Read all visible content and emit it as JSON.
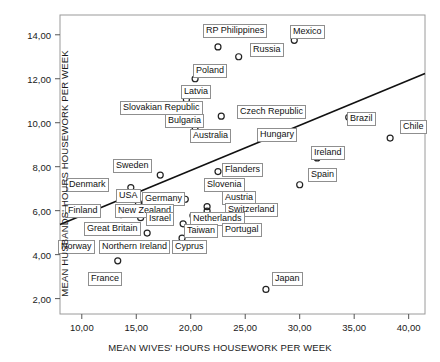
{
  "chart_data": {
    "type": "scatter",
    "title": "",
    "xlabel": "MEAN WIVES' HOURS HOUSEWORK PER WEEK",
    "ylabel": "MEAN HUSBANDS' HOURS HOUSEWORK PER WEEK",
    "xlim": [
      8.0,
      41.5
    ],
    "ylim": [
      1.3,
      14.9
    ],
    "xticks": [
      "10,00",
      "15,00",
      "20,00",
      "25,00",
      "30,00",
      "35,00",
      "40,00"
    ],
    "xtick_values": [
      10,
      15,
      20,
      25,
      30,
      35,
      40
    ],
    "yticks": [
      "2,00",
      "4,00",
      "6,00",
      "8,00",
      "10,00",
      "12,00",
      "14,00"
    ],
    "ytick_values": [
      2,
      4,
      6,
      8,
      10,
      12,
      14
    ],
    "grid": false,
    "legend": "none",
    "marker": "open-circle",
    "marker_color": "#222222",
    "frame_color": "#9a9a9a",
    "fit_line": {
      "label": "linear fit",
      "color": "#111111",
      "x_start": 8.0,
      "y_start": 5.37,
      "x_end": 41.5,
      "y_end": 12.24
    },
    "points": [
      {
        "label": "RP Philippines",
        "x": 22.5,
        "y": 13.45,
        "lx": 203,
        "ly": 24,
        "lanchor": "below"
      },
      {
        "label": "Mexico",
        "x": 29.5,
        "y": 13.75,
        "lx": 290,
        "ly": 25,
        "lanchor": "right"
      },
      {
        "label": "Russia",
        "x": 24.4,
        "y": 13.0,
        "lx": 250,
        "ly": 43,
        "lanchor": "right"
      },
      {
        "label": "Poland",
        "x": 20.4,
        "y": 12.0,
        "lx": 193,
        "ly": 64,
        "lanchor": "right"
      },
      {
        "label": "Latvia",
        "x": 19.6,
        "y": 11.05,
        "lx": 181,
        "ly": 85,
        "lanchor": "above"
      },
      {
        "label": "Slovakian Republic",
        "x": 20.4,
        "y": 10.52,
        "lx": 120,
        "ly": 101,
        "lanchor": "left"
      },
      {
        "label": "Bulgaria",
        "x": 20.6,
        "y": 10.22,
        "lx": 165,
        "ly": 114,
        "lanchor": "left"
      },
      {
        "label": "Czech Republic",
        "x": 22.8,
        "y": 10.3,
        "lx": 237,
        "ly": 105,
        "lanchor": "right"
      },
      {
        "label": "Australia",
        "x": 20.4,
        "y": 9.78,
        "lx": 190,
        "ly": 129,
        "lanchor": "below"
      },
      {
        "label": "Hungary",
        "x": 23.2,
        "y": 9.38,
        "lx": 257,
        "ly": 128,
        "lanchor": "right"
      },
      {
        "label": "Brazil",
        "x": 34.5,
        "y": 10.25,
        "lx": 347,
        "ly": 112,
        "lanchor": "right"
      },
      {
        "label": "Chile",
        "x": 38.3,
        "y": 9.3,
        "lx": 400,
        "ly": 120,
        "lanchor": "right"
      },
      {
        "label": "Ireland",
        "x": 31.6,
        "y": 8.4,
        "lx": 311,
        "ly": 146,
        "lanchor": "above"
      },
      {
        "label": "Spain",
        "x": 30.0,
        "y": 7.18,
        "lx": 308,
        "ly": 168,
        "lanchor": "right"
      },
      {
        "label": "Flanders",
        "x": 22.5,
        "y": 7.78,
        "lx": 222,
        "ly": 163,
        "lanchor": "right"
      },
      {
        "label": "Slovenia",
        "x": 22.0,
        "y": 7.2,
        "lx": 204,
        "ly": 178,
        "lanchor": "right"
      },
      {
        "label": "Sweden",
        "x": 17.2,
        "y": 7.62,
        "lx": 113,
        "ly": 159,
        "lanchor": "above"
      },
      {
        "label": "Denmark",
        "x": 14.5,
        "y": 7.05,
        "lx": 66,
        "ly": 178,
        "lanchor": "left"
      },
      {
        "label": "USA",
        "x": 15.2,
        "y": 6.35,
        "lx": 116,
        "ly": 189,
        "lanchor": "above"
      },
      {
        "label": "Germany",
        "x": 19.5,
        "y": 6.52,
        "lx": 142,
        "ly": 192,
        "lanchor": "left"
      },
      {
        "label": "Austria",
        "x": 21.5,
        "y": 6.18,
        "lx": 222,
        "ly": 191,
        "lanchor": "above"
      },
      {
        "label": "Switzerland",
        "x": 21.5,
        "y": 5.98,
        "lx": 225,
        "ly": 203,
        "lanchor": "right"
      },
      {
        "label": "Finland",
        "x": 13.6,
        "y": 5.82,
        "lx": 65,
        "ly": 204,
        "lanchor": "left"
      },
      {
        "label": "New Zealand",
        "x": 14.6,
        "y": 6.05,
        "lx": 115,
        "ly": 204,
        "lanchor": "right"
      },
      {
        "label": "Netherlands",
        "x": 20.2,
        "y": 5.78,
        "lx": 190,
        "ly": 212,
        "lanchor": "right"
      },
      {
        "label": "Great Britain",
        "x": 15.4,
        "y": 5.68,
        "lx": 84,
        "ly": 222,
        "lanchor": "left"
      },
      {
        "label": "Israel",
        "x": 17.2,
        "y": 5.72,
        "lx": 146,
        "ly": 212,
        "lanchor": "left"
      },
      {
        "label": "Taiwan",
        "x": 19.3,
        "y": 5.4,
        "lx": 184,
        "ly": 224,
        "lanchor": "right"
      },
      {
        "label": "Portugal",
        "x": 22.6,
        "y": 5.58,
        "lx": 222,
        "ly": 223,
        "lanchor": "below"
      },
      {
        "label": "Cyprus",
        "x": 19.2,
        "y": 4.75,
        "lx": 172,
        "ly": 240,
        "lanchor": "right"
      },
      {
        "label": "Northern Ireland",
        "x": 16.0,
        "y": 4.98,
        "lx": 99,
        "ly": 240,
        "lanchor": "left"
      },
      {
        "label": "Norway",
        "x": 12.3,
        "y": 4.35,
        "lx": 58,
        "ly": 240,
        "lanchor": "left"
      },
      {
        "label": "France",
        "x": 13.3,
        "y": 3.72,
        "lx": 88,
        "ly": 272,
        "lanchor": "below"
      },
      {
        "label": "Japan",
        "x": 26.9,
        "y": 2.42,
        "lx": 272,
        "ly": 272,
        "lanchor": "right"
      }
    ]
  }
}
